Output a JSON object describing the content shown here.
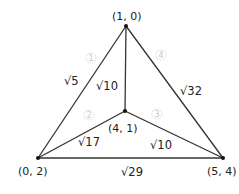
{
  "diagram": {
    "type": "graph",
    "vertices": [
      {
        "id": "top",
        "label": "(1, 0)",
        "x": 126,
        "y": 26
      },
      {
        "id": "center",
        "label": "(4, 1)",
        "x": 125,
        "y": 111
      },
      {
        "id": "bottom_left",
        "label": "(0, 2)",
        "x": 38,
        "y": 158
      },
      {
        "id": "bottom_right",
        "label": "(5, 4)",
        "x": 223,
        "y": 158
      }
    ],
    "edges": [
      {
        "from": "top",
        "to": "bottom_left",
        "label": "√5"
      },
      {
        "from": "top",
        "to": "center",
        "label": "√10"
      },
      {
        "from": "top",
        "to": "bottom_right",
        "label": "√32"
      },
      {
        "from": "center",
        "to": "bottom_left",
        "label": "√17"
      },
      {
        "from": "center",
        "to": "bottom_right",
        "label": "√10"
      },
      {
        "from": "bottom_left",
        "to": "bottom_right",
        "label": "√29"
      }
    ],
    "markers": [
      "1",
      "2",
      "3",
      "4"
    ]
  }
}
